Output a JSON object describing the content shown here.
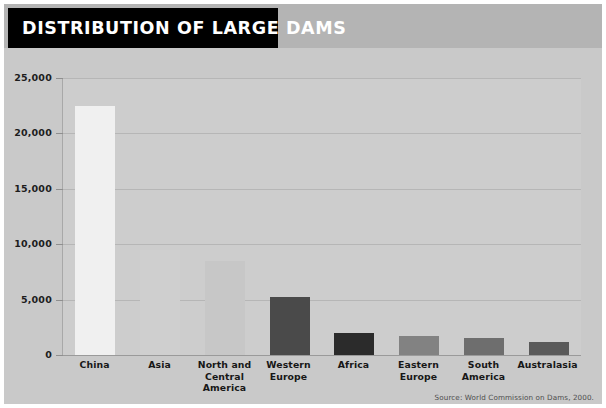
{
  "header": {
    "title": "DISTRIBUTION OF LARGE DAMS"
  },
  "footer": {
    "source": "Source: World Commission on Dams, 2000."
  },
  "colors": {
    "page_background": "#ffffff",
    "canvas_background": "#c9c9c9",
    "title_band": "#b4b4b4",
    "title_box": "#000000",
    "title_text": "#ffffff",
    "plot_background": "#cdcdcd",
    "gridline": "#b6b6b6",
    "axis_line": "#9a9a9a",
    "tick_label": "#1d1d1d",
    "category_label": "#171717",
    "source_text": "#4d4d4d"
  },
  "chart_data": {
    "type": "bar",
    "title": "DISTRIBUTION OF LARGE DAMS",
    "xlabel": "",
    "ylabel": "",
    "ylim": [
      0,
      25000
    ],
    "grid": true,
    "legend": "none",
    "yticks": [
      0,
      5000,
      10000,
      15000,
      20000,
      25000
    ],
    "ytick_labels": [
      "0",
      "5,000",
      "10,000",
      "15,000",
      "20,000",
      "25,000"
    ],
    "categories": [
      "China",
      "Asia",
      "North and Central America",
      "Western Europe",
      "Africa",
      "Eastern Europe",
      "South America",
      "Australasia"
    ],
    "category_label_lines": [
      [
        "China"
      ],
      [
        "Asia"
      ],
      [
        "North and",
        "Central America"
      ],
      [
        "Western",
        "Europe"
      ],
      [
        "Africa"
      ],
      [
        "Eastern",
        "Europe"
      ],
      [
        "South",
        "America"
      ],
      [
        "Australasia"
      ]
    ],
    "values": [
      22500,
      9500,
      8500,
      5200,
      2000,
      1700,
      1500,
      1200
    ],
    "bar_colors": [
      "#f0f0f0",
      "#cfcfcf",
      "#c7c7c7",
      "#4a4a4a",
      "#2b2b2b",
      "#828282",
      "#6e6e6e",
      "#5a5a5a"
    ],
    "annotations": [
      "Source: World Commission on Dams, 2000."
    ]
  }
}
